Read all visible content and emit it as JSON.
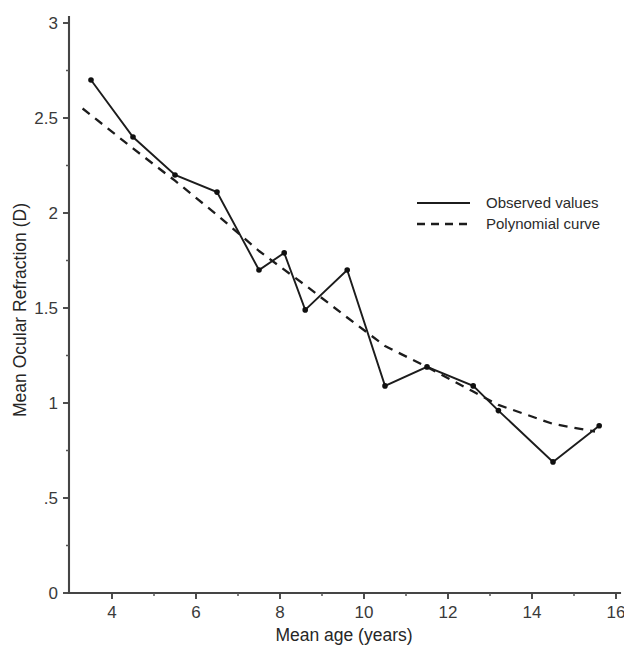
{
  "chart_data": {
    "type": "line",
    "title": "",
    "xlabel": "Mean age (years)",
    "ylabel": "Mean Ocular Refraction (D)",
    "xlim": [
      3,
      16
    ],
    "ylim": [
      0,
      3
    ],
    "grid": false,
    "legend_position": "upper-right",
    "x_ticks_major": [
      "4",
      "6",
      "8",
      "10",
      "12",
      "14",
      "16"
    ],
    "x_ticks_major_values": [
      4,
      6,
      8,
      10,
      12,
      14,
      16
    ],
    "x_ticks_minor_values": [
      5,
      7,
      9,
      11,
      13,
      15
    ],
    "y_ticks_major": [
      "0",
      ".5",
      "1",
      "1.5",
      "2",
      "2.5",
      "3"
    ],
    "y_ticks_major_values": [
      0,
      0.5,
      1,
      1.5,
      2,
      2.5,
      3
    ],
    "y_ticks_minor_values": [
      0.25,
      0.75,
      1.25,
      1.75,
      2.25,
      2.75
    ],
    "series": [
      {
        "name": "Observed values",
        "style": "solid",
        "markers": true,
        "x": [
          3.5,
          4.5,
          5.5,
          6.5,
          7.5,
          8.1,
          8.6,
          9.6,
          10.5,
          11.5,
          12.6,
          13.2,
          14.5,
          15.6
        ],
        "values": [
          2.7,
          2.4,
          2.2,
          2.11,
          1.7,
          1.79,
          1.49,
          1.7,
          1.09,
          1.19,
          1.09,
          0.96,
          0.69,
          0.88
        ]
      },
      {
        "name": "Polynomial curve",
        "style": "dashed",
        "markers": false,
        "x": [
          3.3,
          4.5,
          5.5,
          6.5,
          7.5,
          8.6,
          9.6,
          10.5,
          11.5,
          12.6,
          13.2,
          14.5,
          15.5
        ],
        "values": [
          2.55,
          2.34,
          2.17,
          1.99,
          1.8,
          1.62,
          1.45,
          1.3,
          1.19,
          1.06,
          0.99,
          0.89,
          0.85
        ]
      }
    ]
  },
  "legend": {
    "entries": [
      {
        "label": "Observed values",
        "style": "solid"
      },
      {
        "label": "Polynomial curve",
        "style": "dashed"
      }
    ]
  },
  "axes": {
    "x_title": "Mean age (years)",
    "y_title": "Mean Ocular Refraction (D)"
  },
  "colors": {
    "line": "#1c1c1c",
    "axis": "#454545",
    "text": "#2b2b2b",
    "background": "#ffffff"
  }
}
